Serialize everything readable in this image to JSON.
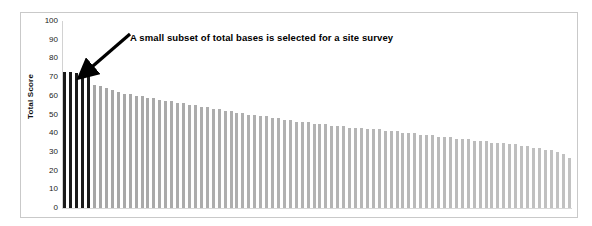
{
  "chart_data": {
    "type": "bar",
    "title": "",
    "subtitle": "",
    "xlabel": "",
    "ylabel": "Total Score",
    "ylim": [
      0,
      100
    ],
    "yticks": [
      100,
      90,
      80,
      70,
      60,
      50,
      40,
      30,
      20,
      10,
      0
    ],
    "grid": false,
    "legend": null,
    "legend_position": "none",
    "xtick_labels": [],
    "annotations": [
      {
        "text": "A small subset of total bases is selected for a site survey",
        "type": "arrow-callout",
        "points_to": "leftmost-highlighted-bars"
      }
    ],
    "series": [
      {
        "name": "Total Score",
        "highlight_count": 5,
        "highlight_color": "#1a1a1a",
        "base_color": "#b9b9b9",
        "values": [
          73,
          73,
          72,
          72,
          71,
          66,
          65,
          64,
          63,
          62,
          61,
          61,
          60,
          60,
          59,
          59,
          58,
          57,
          57,
          56,
          56,
          55,
          55,
          54,
          54,
          53,
          53,
          52,
          52,
          51,
          51,
          50,
          50,
          49,
          49,
          48,
          48,
          47,
          47,
          46,
          46,
          46,
          45,
          45,
          45,
          44,
          44,
          44,
          43,
          43,
          43,
          42,
          42,
          42,
          41,
          41,
          41,
          40,
          40,
          40,
          39,
          39,
          39,
          38,
          38,
          38,
          37,
          37,
          37,
          36,
          36,
          36,
          35,
          35,
          35,
          34,
          34,
          33,
          33,
          32,
          32,
          31,
          31,
          30,
          29,
          27
        ]
      }
    ]
  },
  "colors": {
    "highlight": "#1a1a1a",
    "bars": "#b9b9b9",
    "frame": "#c9c9c9",
    "text": "#111111",
    "background": "#ffffff"
  }
}
